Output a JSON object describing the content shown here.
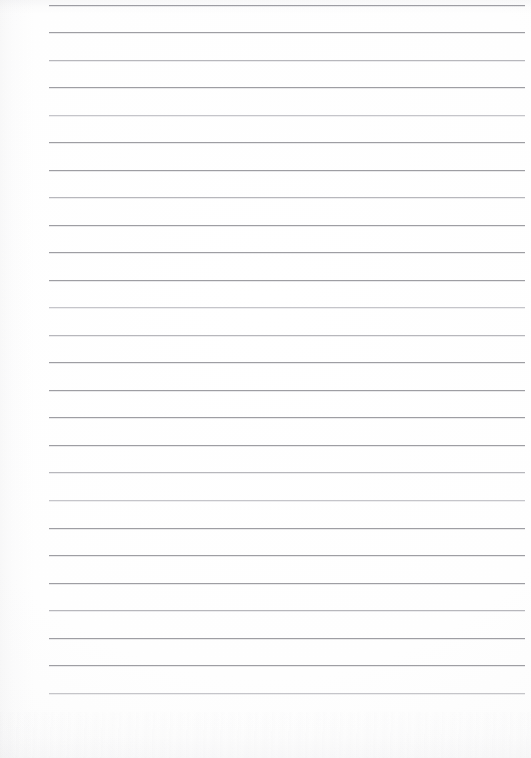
{
  "document": {
    "kind": "scanned-lined-paper",
    "title": "Blank Lined Paper",
    "content_text": "",
    "has_text": false,
    "has_handwriting": false,
    "page_width_px": 531,
    "page_height_px": 758,
    "background_color": "#ffffff",
    "rule_color": "#96969c",
    "rule_thickness_px": 1
  },
  "ruling": {
    "line_count": 26,
    "first_line_y": 5,
    "line_spacing_px": 27.5,
    "line_left_x": 49,
    "line_right_x": 525,
    "line_width_px": 476,
    "margin_left_px": 49,
    "margin_right_px": 6,
    "vertical_margin_rule": false,
    "lines_y": [
      5,
      32,
      60,
      87,
      115,
      142,
      170,
      197,
      225,
      252,
      280,
      307,
      335,
      362,
      390,
      417,
      445,
      472,
      500,
      528,
      555,
      583,
      610,
      638,
      665,
      693
    ]
  },
  "scan_artifacts": {
    "top_noise_band": true,
    "bottom_noise_band": true,
    "left_edge_shadow": true,
    "noise_color": "#c8c8ce"
  }
}
